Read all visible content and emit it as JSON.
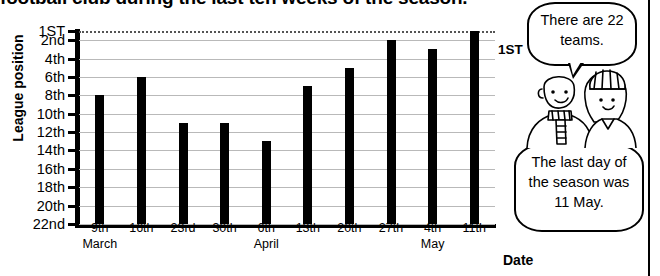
{
  "heading": "football club during the last ten weeks of the season.",
  "chart_data": {
    "type": "bar",
    "title": "football club during the last ten weeks of the season.",
    "xlabel": "Date",
    "ylabel": "League position",
    "categories": [
      "9th",
      "16th",
      "23rd",
      "30th",
      "6th",
      "13th",
      "20th",
      "27th",
      "4th",
      "11th"
    ],
    "months": [
      "March",
      "",
      "",
      "",
      "April",
      "",
      "",
      "",
      "May",
      ""
    ],
    "values": [
      8,
      6,
      11,
      11,
      13,
      7,
      5,
      2,
      3,
      1
    ],
    "ytick_labels": [
      "1ST",
      "2nd",
      "4th",
      "6th",
      "8th",
      "10th",
      "12th",
      "14th",
      "16th",
      "18th",
      "20th",
      "22nd"
    ],
    "ytick_values": [
      1,
      2,
      4,
      6,
      8,
      10,
      12,
      14,
      16,
      18,
      20,
      22
    ],
    "ylim": [
      1,
      22
    ],
    "y_inverted": true,
    "grid": true,
    "legend": "none",
    "annotations": [
      "1ST"
    ],
    "bar_color": "#000000",
    "grid_color": "#b9b9b9"
  },
  "axis": {
    "y_title": "League position",
    "x_title": "Date",
    "top_line_label": "1ST"
  },
  "speech": {
    "bubble_one": "There are 22 teams.",
    "bubble_two": "The last day of the season was 11 May."
  },
  "figures": {
    "left_person": "bald-man-with-scarf",
    "right_person": "woman-with-striped-hat"
  }
}
